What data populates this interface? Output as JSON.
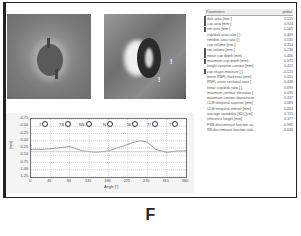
{
  "figure_label": "F",
  "images": [
    {
      "name": "reflectance-image",
      "description": "optic disc reflectance image"
    },
    {
      "name": "topography-image",
      "description": "optic disc topography image with markers"
    }
  ],
  "topography_markers": [
    "!",
    "!"
  ],
  "table": {
    "headers": [
      "Parameters",
      "global"
    ],
    "rows": [
      {
        "label": "disk area [mm²]",
        "value": "1.559",
        "flag": true
      },
      {
        "label": "cup area [mm²]",
        "value": "0.924",
        "flag": true
      },
      {
        "label": "rim area [mm²]",
        "value": "0.565",
        "flag": true
      },
      {
        "label": "cup/disk area ratio [ ]",
        "value": "0.469",
        "flag": false
      },
      {
        "label": "rim/disk area ratio [ ]",
        "value": "0.531",
        "flag": false
      },
      {
        "label": "cup volume [mm³]",
        "value": "0.354",
        "flag": false
      },
      {
        "label": "rim volume [mm³]",
        "value": "0.236",
        "flag": true
      },
      {
        "label": "mean cup depth [mm]",
        "value": "0.406",
        "flag": true
      },
      {
        "label": "maximum cup depth [mm]",
        "value": "0.971",
        "flag": true
      },
      {
        "label": "height variation contour [mm]",
        "value": "0.421",
        "flag": false
      },
      {
        "label": "cup shape measure [ ]",
        "value": "-0.125",
        "flag": true
      },
      {
        "label": "mean RNFL thickness [mm]",
        "value": "0.051",
        "flag": false
      },
      {
        "label": "RNFL cross sectional area [",
        "value": "0.446",
        "flag": false
      },
      {
        "label": "linear cup/disk ratio [ ]",
        "value": "0.699",
        "flag": false
      },
      {
        "label": "maximum contour elevation [",
        "value": "0.095",
        "flag": false
      },
      {
        "label": "maximum contour depression",
        "value": "0.437",
        "flag": false
      },
      {
        "label": "CLM temporal-superior [mm]",
        "value": "0.083",
        "flag": false
      },
      {
        "label": "CLM temporal-inferior [mm]",
        "value": "0.063",
        "flag": false
      },
      {
        "label": "average variability (SD) [µm]",
        "value": "0.115",
        "flag": false
      },
      {
        "label": "reference height [mm]",
        "value": "0.377",
        "flag": false
      },
      {
        "label": "FSM discriminant function va",
        "value": "-0.985",
        "flag": false
      },
      {
        "label": "RB discriminant function valu",
        "value": "-0.046",
        "flag": false
      }
    ]
  },
  "chart_data": {
    "type": "line",
    "title": "",
    "xlabel": "Angle [°]",
    "ylabel": "[mm]",
    "x_ticks": [
      "0",
      "45",
      "90",
      "135",
      "180",
      "225",
      "270",
      "315",
      "360"
    ],
    "y_ticks": [
      "-0.75",
      "-0.50",
      "-0.25",
      "0.00",
      "0.25",
      "0.50",
      "0.75",
      "1.00",
      "1.25"
    ],
    "xlim": [
      0,
      360
    ],
    "ylim": [
      -0.75,
      1.25
    ],
    "y_inverted": true,
    "grid": true,
    "sectors": [
      "T",
      "TS",
      "NS",
      "N",
      "NI",
      "TI",
      "T"
    ],
    "series": [
      {
        "name": "contour height",
        "x": [
          0,
          30,
          60,
          90,
          120,
          150,
          180,
          210,
          240,
          255,
          270,
          290,
          315,
          340,
          360
        ],
        "values": [
          0.3,
          0.3,
          0.25,
          0.2,
          0.35,
          0.4,
          0.35,
          0.2,
          0.05,
          0.0,
          0.05,
          0.3,
          0.4,
          0.35,
          0.35
        ]
      },
      {
        "name": "reference line",
        "x": [
          0,
          360
        ],
        "values": [
          0.38,
          0.38
        ]
      }
    ]
  }
}
